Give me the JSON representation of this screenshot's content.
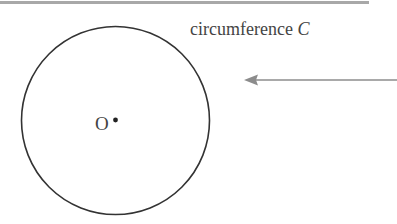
{
  "diagram": {
    "label_prefix": "circumference",
    "label_variable": "C",
    "center_label": "O",
    "colors": {
      "circle_stroke": "#333333",
      "arrow": "#8c8c8c",
      "text": "#444444",
      "top_rule": "#a8a8a8"
    }
  }
}
